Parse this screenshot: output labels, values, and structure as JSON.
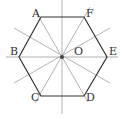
{
  "diagram": {
    "center": {
      "label": "O",
      "x": 62,
      "y": 57
    },
    "vertices": [
      {
        "label": "A",
        "x": 41,
        "y": 17
      },
      {
        "label": "F",
        "x": 84,
        "y": 17
      },
      {
        "label": "E",
        "x": 107,
        "y": 57
      },
      {
        "label": "D",
        "x": 84,
        "y": 96
      },
      {
        "label": "C",
        "x": 41,
        "y": 96
      },
      {
        "label": "B",
        "x": 19,
        "y": 57
      }
    ],
    "labels": {
      "A": "A",
      "B": "B",
      "C": "C",
      "D": "D",
      "E": "E",
      "F": "F",
      "O": "O"
    },
    "colors": {
      "hexagon": "#333333",
      "axes": "#999999",
      "center_dot": "#444444"
    }
  }
}
